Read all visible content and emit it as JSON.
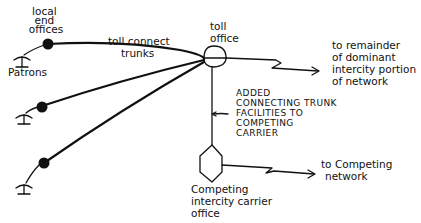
{
  "diagram": {
    "type": "network-schematic",
    "labels": {
      "local_end_offices": [
        "local",
        "end",
        "offices"
      ],
      "patrons": "Patrons",
      "toll_connect_trunks": [
        "toll connect",
        "trunks"
      ],
      "toll_office": [
        "toll",
        "office"
      ],
      "to_remainder": [
        "to remainder",
        "of dominant",
        "intercity portion",
        "of network"
      ],
      "added_trunk": [
        "ADDED",
        "CONNECTING TRUNK",
        "FACILITIES TO",
        "COMPETING",
        "CARRIER"
      ],
      "competing_office": [
        "Competing",
        "intercity carrier",
        "office"
      ],
      "to_competing": [
        "to Competing",
        "network"
      ]
    },
    "nodes": [
      {
        "id": "patron-1",
        "kind": "telephone"
      },
      {
        "id": "patron-2",
        "kind": "telephone"
      },
      {
        "id": "patron-3",
        "kind": "telephone"
      },
      {
        "id": "local-end-office-1",
        "kind": "filled-circle"
      },
      {
        "id": "local-end-office-2",
        "kind": "filled-circle"
      },
      {
        "id": "local-end-office-3",
        "kind": "filled-circle"
      },
      {
        "id": "toll-office",
        "kind": "split-circle"
      },
      {
        "id": "competing-carrier-office",
        "kind": "hexagon"
      }
    ],
    "edges": [
      {
        "from": "patron-1",
        "to": "local-end-office-1"
      },
      {
        "from": "patron-2",
        "to": "local-end-office-2"
      },
      {
        "from": "patron-3",
        "to": "local-end-office-3"
      },
      {
        "from": "local-end-office-1",
        "to": "toll-office",
        "label": "toll connect trunks"
      },
      {
        "from": "local-end-office-2",
        "to": "toll-office"
      },
      {
        "from": "local-end-office-3",
        "to": "toll-office"
      },
      {
        "from": "toll-office",
        "to": "remainder-of-network",
        "style": "lightning-arrow"
      },
      {
        "from": "toll-office",
        "to": "competing-carrier-office",
        "label": "added connecting trunk facilities"
      },
      {
        "from": "competing-carrier-office",
        "to": "competing-network",
        "style": "lightning-arrow"
      }
    ]
  }
}
